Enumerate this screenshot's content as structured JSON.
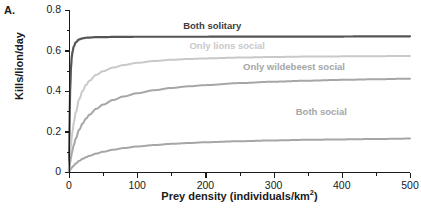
{
  "panel": {
    "letter": "A."
  },
  "chart_data": {
    "type": "line",
    "title": "",
    "xlabel": "Prey density (individuals/km",
    "xlabel_sup": "2",
    "xlabel_suffix": ")",
    "xlabel_full": "Prey density (individuals/km2)",
    "ylabel": "Kills/lion/day",
    "xlim": [
      0,
      500
    ],
    "ylim": [
      0,
      0.8
    ],
    "xticks": [
      0,
      100,
      200,
      300,
      400,
      500
    ],
    "xticklabels": [
      "0",
      "100",
      "200",
      "300",
      "400",
      "500"
    ],
    "xminorticks": [
      50,
      150,
      250,
      350,
      450
    ],
    "yticks": [
      0,
      0.2,
      0.4,
      0.6,
      0.8
    ],
    "yticklabels": [
      "0",
      "0.2",
      "0.4",
      "0.6",
      "0.8"
    ],
    "yminorticks": [
      0.1,
      0.3,
      0.5,
      0.7
    ],
    "grid": false,
    "legend": "inline-annotations",
    "x": [
      0,
      1,
      2,
      3,
      4,
      5,
      7,
      10,
      15,
      20,
      25,
      30,
      40,
      50,
      65,
      80,
      100,
      125,
      150,
      175,
      200,
      250,
      300,
      350,
      400,
      450,
      500
    ],
    "series": [
      {
        "name": "Both solitary",
        "color": "#555555",
        "asymptote": 0.67,
        "values": [
          0,
          0.3,
          0.44,
          0.52,
          0.565,
          0.592,
          0.62,
          0.641,
          0.655,
          0.66,
          0.663,
          0.664,
          0.666,
          0.666,
          0.667,
          0.667,
          0.668,
          0.668,
          0.668,
          0.668,
          0.668,
          0.669,
          0.669,
          0.669,
          0.669,
          0.67,
          0.67
        ],
        "label": "Both solitary",
        "label_x": 210,
        "label_y": 0.715
      },
      {
        "name": "Only lions social",
        "color": "#c9c9c9",
        "asymptote": 0.575,
        "values": [
          0,
          0.055,
          0.1,
          0.138,
          0.17,
          0.198,
          0.243,
          0.295,
          0.36,
          0.401,
          0.43,
          0.451,
          0.48,
          0.498,
          0.516,
          0.528,
          0.539,
          0.548,
          0.554,
          0.558,
          0.561,
          0.565,
          0.568,
          0.57,
          0.571,
          0.572,
          0.573
        ],
        "label": "Only lions social",
        "label_x": 232,
        "label_y": 0.617
      },
      {
        "name": "Only wildebeest social",
        "color": "#a6a6a6",
        "asymptote": 0.47,
        "values": [
          0,
          0.028,
          0.052,
          0.072,
          0.09,
          0.106,
          0.133,
          0.166,
          0.209,
          0.24,
          0.264,
          0.283,
          0.312,
          0.333,
          0.356,
          0.373,
          0.389,
          0.404,
          0.415,
          0.423,
          0.429,
          0.439,
          0.446,
          0.451,
          0.455,
          0.458,
          0.461
        ],
        "label": "Only wildebeest social",
        "label_x": 330,
        "label_y": 0.512
      },
      {
        "name": "Both social",
        "color": "#a6a6a6",
        "asymptote": 0.18,
        "values": [
          0,
          0.006,
          0.011,
          0.016,
          0.021,
          0.025,
          0.032,
          0.042,
          0.055,
          0.065,
          0.073,
          0.08,
          0.091,
          0.1,
          0.11,
          0.118,
          0.126,
          0.133,
          0.139,
          0.143,
          0.147,
          0.152,
          0.156,
          0.159,
          0.161,
          0.163,
          0.165
        ],
        "label": "Both social",
        "label_x": 370,
        "label_y": 0.29
      }
    ]
  },
  "axes": {
    "color": "#1a1a1a"
  }
}
